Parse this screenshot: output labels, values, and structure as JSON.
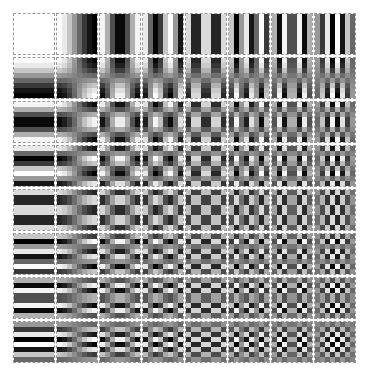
{
  "figure": {
    "rows": 8,
    "cols": 8,
    "block_size": 8,
    "tile_px": 40,
    "pitch_x": 43,
    "pitch_y": 44,
    "positive_color": "#ffffff",
    "negative_color": "#000000",
    "tile_border_color": "#9a9a9a",
    "background": "#ffffff"
  }
}
